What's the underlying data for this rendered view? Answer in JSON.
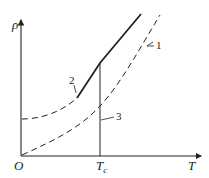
{
  "diagram": {
    "axes": {
      "y_label": "ρ",
      "x_label": "T",
      "origin_label": "O",
      "tick_label": "T",
      "tick_subscript": "c"
    },
    "curves": [
      {
        "id": "1",
        "label": "1",
        "style": "dashed",
        "description": "normal-state resistivity extension"
      },
      {
        "id": "2",
        "label": "2",
        "style": "solid",
        "description": "measured resistivity above Tc"
      },
      {
        "id": "3",
        "label": "3",
        "style": "dashed",
        "description": "resistivity curve through origin"
      }
    ],
    "colors": {
      "line": "#222222",
      "background": "#ffffff"
    }
  }
}
